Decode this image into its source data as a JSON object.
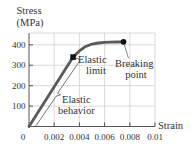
{
  "chart_data": {
    "type": "line",
    "title": "",
    "xlabel": "Strain",
    "ylabel": "Stress (MPa)",
    "ylabel_lines": [
      "Stress",
      "(MPa)"
    ],
    "xlim": [
      0,
      0.01
    ],
    "ylim": [
      0,
      458
    ],
    "grid": true,
    "legend": null,
    "origin_label": "0",
    "x_ticks": [
      0.002,
      0.004,
      0.006,
      0.008,
      0.01
    ],
    "x_tick_labels": [
      "0.002",
      "0.004",
      "0.006",
      "0.008",
      "0.01"
    ],
    "y_ticks": [
      100,
      200,
      300,
      400
    ],
    "y_tick_labels": [
      "100",
      "200",
      "300",
      "400"
    ],
    "series": [
      {
        "name": "Stress-strain curve",
        "x": [
          0,
          0.0035,
          0.004,
          0.0045,
          0.005,
          0.0055,
          0.006,
          0.0065,
          0.007,
          0.0075
        ],
        "y": [
          0,
          340,
          370,
          392,
          404,
          409,
          412,
          413,
          414,
          415
        ]
      }
    ],
    "annotations": [
      {
        "label": [
          "Elastic",
          "limit"
        ],
        "x": 0.0035,
        "y": 340,
        "marker": "square"
      },
      {
        "label": [
          "Breaking",
          "point"
        ],
        "x": 0.0075,
        "y": 415,
        "marker": "circle"
      },
      {
        "label": [
          "Elastic",
          "behavior"
        ],
        "type": "bracket",
        "x_range": [
          0,
          0.0035
        ]
      }
    ]
  },
  "colors": {
    "curve": "#5a5a5a",
    "axis": "#555555",
    "grid": "#cfcfcf",
    "marker": "#111111",
    "bracket": "#555555",
    "text": "#333333"
  }
}
